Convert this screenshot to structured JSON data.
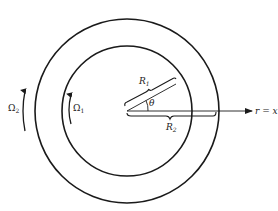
{
  "diagram": {
    "type": "concentric-cylinders",
    "labels": {
      "outer_rotation": "Ω",
      "outer_rotation_sub": "2",
      "inner_rotation": "Ω",
      "inner_rotation_sub": "1",
      "inner_radius": "R",
      "inner_radius_sub": "1",
      "outer_radius": "R",
      "outer_radius_sub": "2",
      "angle": "θ",
      "axis": "r = x",
      "axis_sup": "1"
    },
    "colors": {
      "stroke": "#1a1a1a",
      "background": "#ffffff"
    }
  }
}
